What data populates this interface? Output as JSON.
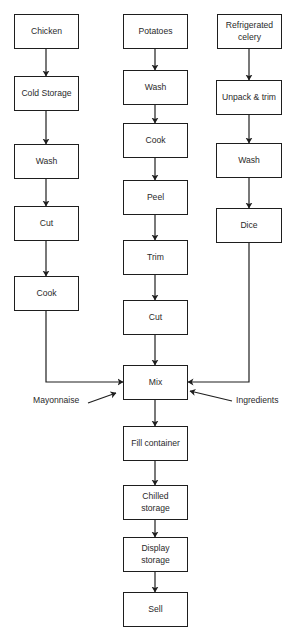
{
  "diagram": {
    "type": "process-flowchart",
    "line_color": "#1e1e1e",
    "text_color": "#2a2a2a",
    "columns": {
      "chicken": {
        "nodes": [
          {
            "id": "chicken",
            "label": "Chicken"
          },
          {
            "id": "cold_storage",
            "label": "Cold Storage"
          },
          {
            "id": "wash_chicken",
            "label": "Wash"
          },
          {
            "id": "cut_chicken",
            "label": "Cut"
          },
          {
            "id": "cook_chicken",
            "label": "Cook"
          }
        ]
      },
      "potatoes": {
        "nodes": [
          {
            "id": "potatoes",
            "label": "Potatoes"
          },
          {
            "id": "wash_potatoes",
            "label": "Wash"
          },
          {
            "id": "cook_potatoes",
            "label": "Cook"
          },
          {
            "id": "peel",
            "label": "Peel"
          },
          {
            "id": "trim",
            "label": "Trim"
          },
          {
            "id": "cut_potatoes",
            "label": "Cut"
          }
        ]
      },
      "celery": {
        "nodes": [
          {
            "id": "refrigerated_celery",
            "label": "Refrigerated\ncelery"
          },
          {
            "id": "unpack_trim",
            "label": "Unpack & trim"
          },
          {
            "id": "wash_celery",
            "label": "Wash"
          },
          {
            "id": "dice",
            "label": "Dice"
          }
        ]
      }
    },
    "merge": {
      "nodes": [
        {
          "id": "mix",
          "label": "Mix"
        },
        {
          "id": "fill_container",
          "label": "Fill container"
        },
        {
          "id": "chilled_storage",
          "label": "Chilled\nstorage"
        },
        {
          "id": "display_storage",
          "label": "Display\nstorage"
        },
        {
          "id": "sell",
          "label": "Sell"
        }
      ]
    },
    "external_inputs": [
      {
        "id": "mayonnaise",
        "label": "Mayonnaise",
        "target": "mix"
      },
      {
        "id": "ingredients",
        "label": "Ingredients",
        "target": "mix"
      }
    ],
    "edges": [
      [
        "chicken",
        "cold_storage"
      ],
      [
        "cold_storage",
        "wash_chicken"
      ],
      [
        "wash_chicken",
        "cut_chicken"
      ],
      [
        "cut_chicken",
        "cook_chicken"
      ],
      [
        "cook_chicken",
        "mix"
      ],
      [
        "potatoes",
        "wash_potatoes"
      ],
      [
        "wash_potatoes",
        "cook_potatoes"
      ],
      [
        "cook_potatoes",
        "peel"
      ],
      [
        "peel",
        "trim"
      ],
      [
        "trim",
        "cut_potatoes"
      ],
      [
        "cut_potatoes",
        "mix"
      ],
      [
        "refrigerated_celery",
        "unpack_trim"
      ],
      [
        "unpack_trim",
        "wash_celery"
      ],
      [
        "wash_celery",
        "dice"
      ],
      [
        "dice",
        "mix"
      ],
      [
        "mayonnaise",
        "mix"
      ],
      [
        "ingredients",
        "mix"
      ],
      [
        "mix",
        "fill_container"
      ],
      [
        "fill_container",
        "chilled_storage"
      ],
      [
        "chilled_storage",
        "display_storage"
      ],
      [
        "display_storage",
        "sell"
      ]
    ]
  }
}
